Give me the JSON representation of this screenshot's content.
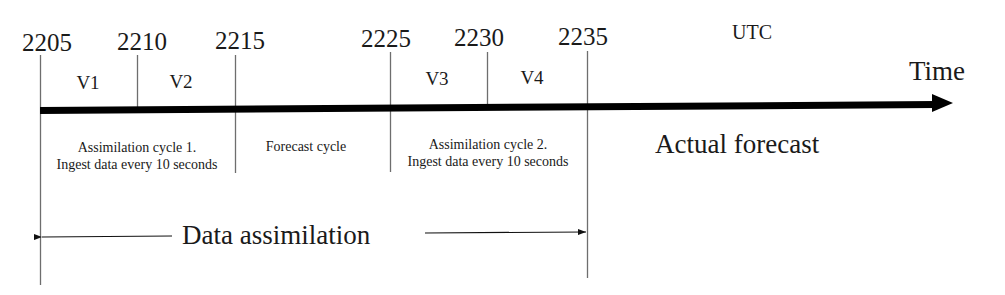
{
  "diagram": {
    "type": "timeline",
    "unit_label": "UTC",
    "axis_label": "Time",
    "ticks": [
      {
        "label": "2205",
        "x": 40
      },
      {
        "label": "2210",
        "x": 137
      },
      {
        "label": "2215",
        "x": 235
      },
      {
        "label": "2225",
        "x": 390
      },
      {
        "label": "2230",
        "x": 487
      },
      {
        "label": "2235",
        "x": 587
      }
    ],
    "volumes": [
      {
        "label": "V1",
        "x": 88
      },
      {
        "label": "V2",
        "x": 181
      },
      {
        "label": "V3",
        "x": 437
      },
      {
        "label": "V4",
        "x": 532
      }
    ],
    "segments": [
      {
        "line1": "Assimilation cycle 1.",
        "line2": "Ingest data every 10 seconds",
        "x": 137
      },
      {
        "line1": "Forecast cycle",
        "line2": "",
        "x": 305
      },
      {
        "line1": "Assimilation cycle 2.",
        "line2": "Ingest data every 10 seconds",
        "x": 488
      }
    ],
    "actual_forecast_label": "Actual forecast",
    "span": {
      "label": "Data assimilation",
      "from": "2205",
      "to": "2235"
    },
    "colors": {
      "axis": "#000000",
      "tick_line": "#6e6e6e",
      "text": "#1a1a1a",
      "background": "#ffffff"
    }
  }
}
